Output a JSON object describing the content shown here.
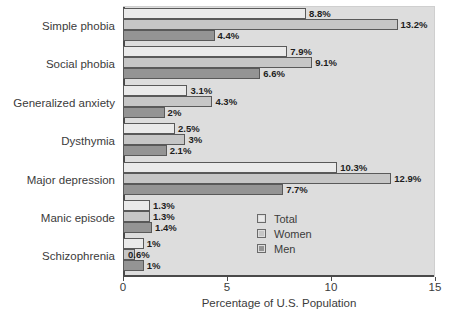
{
  "chart_data": {
    "type": "bar",
    "orientation": "horizontal",
    "title": "",
    "xlabel": "Percentage of U.S. Population",
    "ylabel": "",
    "xlim": [
      0,
      15
    ],
    "xticks": [
      "0",
      "5",
      "10",
      "15"
    ],
    "grid": false,
    "legend_position": "inside-lower-right",
    "categories": [
      "Simple phobia",
      "Social phobia",
      "Generalized anxiety",
      "Dysthymia",
      "Major depression",
      "Manic episode",
      "Schizophrenia"
    ],
    "series": [
      {
        "name": "Total",
        "color": "#eaeaea",
        "values": [
          8.8,
          7.9,
          3.1,
          2.5,
          10.3,
          1.3,
          1.0
        ],
        "labels": [
          "8.8%",
          "7.9%",
          "3.1%",
          "2.5%",
          "10.3%",
          "1.3%",
          "1%"
        ]
      },
      {
        "name": "Women",
        "color": "#c6c6c6",
        "values": [
          13.2,
          9.1,
          4.3,
          3.0,
          12.9,
          1.3,
          0.6
        ],
        "labels": [
          "13.2%",
          "9.1%",
          "4.3%",
          "3%",
          "12.9%",
          "1.3%",
          "0.6%"
        ]
      },
      {
        "name": "Men",
        "color": "#949494",
        "values": [
          4.4,
          6.6,
          2.0,
          2.1,
          7.7,
          1.4,
          1.0
        ],
        "labels": [
          "4.4%",
          "6.6%",
          "2%",
          "2.1%",
          "7.7%",
          "1.4%",
          "1%"
        ]
      }
    ]
  },
  "legend": {
    "items": [
      {
        "label": "Total"
      },
      {
        "label": "Women"
      },
      {
        "label": "Men"
      }
    ]
  },
  "axis": {
    "x_title": "Percentage of U.S. Population",
    "ticks": [
      {
        "label": "0",
        "value": 0
      },
      {
        "label": "5",
        "value": 5
      },
      {
        "label": "10",
        "value": 10
      },
      {
        "label": "15",
        "value": 15
      }
    ]
  }
}
